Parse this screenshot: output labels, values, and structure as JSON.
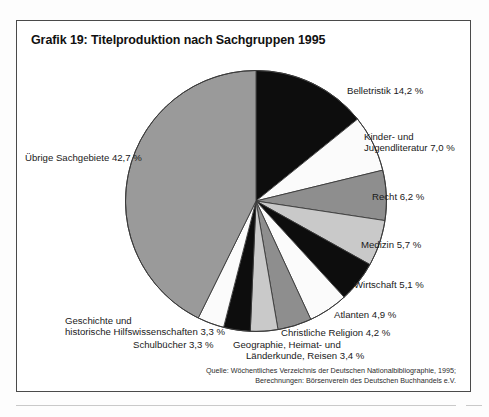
{
  "figure": {
    "title": "Grafik 19: Titelproduktion nach Sachgruppen 1995",
    "source_line_1": "Quelle: Wöchentliches Verzeichnis der Deutschen Nationalbibliographie, 1995;",
    "source_line_2": "Berechnungen: Börsenverein des Deutschen Buchhandels e.V."
  },
  "labels": {
    "belletristik": "Belletristik 14,2 %",
    "kinder_line1": "Kinder- und",
    "kinder_line2": "Jugendliteratur 7,0 %",
    "recht": "Recht 6,2 %",
    "medizin": "Medizin 5,7 %",
    "wirtschaft": "Wirtschaft 5,1 %",
    "atlanten": "Atlanten 4,9 %",
    "christliche_religion": "Christliche Religion 4,2 %",
    "geographie_line1": "Geographie, Heimat- und",
    "geographie_line2": "Länderkunde, Reisen 3,4 %",
    "schulbuecher": "Schulbücher 3,3 %",
    "geschichte_line1": "Geschichte und",
    "geschichte_line2": "historische Hilfswissenschaften 3,3 %",
    "uebrige": "Übrige Sachgebiete 42,7 %"
  },
  "chart_data": {
    "type": "pie",
    "title": "Grafik 19: Titelproduktion nach Sachgruppen 1995",
    "unit": "%",
    "start_angle_deg": 0,
    "direction": "clockwise",
    "legend": "none-inline-labels",
    "grid": false,
    "categories": [
      "Belletristik",
      "Kinder- und Jugendliteratur",
      "Recht",
      "Medizin",
      "Wirtschaft",
      "Atlanten",
      "Christliche Religion",
      "Geographie, Heimat- und Länderkunde, Reisen",
      "Schulbücher",
      "Geschichte und historische Hilfswissenschaften",
      "Übrige Sachgebiete"
    ],
    "values": [
      14.2,
      7.0,
      6.2,
      5.7,
      5.1,
      4.9,
      4.2,
      3.4,
      3.3,
      3.3,
      42.7
    ],
    "value_labels": [
      "14,2 %",
      "7,0 %",
      "6,2 %",
      "5,7 %",
      "5,1 %",
      "4,9 %",
      "4,2 %",
      "3,4 %",
      "3,3 %",
      "3,3 %",
      "42,7 %"
    ],
    "slice_colors": [
      "#0d0d0d",
      "#fbfbfb",
      "#8e8e8e",
      "#c9c9c9",
      "#0d0d0d",
      "#fbfbfb",
      "#8e8e8e",
      "#c9c9c9",
      "#0d0d0d",
      "#fbfbfb",
      "#9a9a9a"
    ],
    "stroke_color": "#3a3a3a",
    "total": 100.0
  },
  "colors": {
    "frame": "#4a4a4a",
    "black_slice": "#0d0d0d",
    "white_slice": "#fbfbfb",
    "gray_slice": "#8e8e8e",
    "light_gray_slice": "#c9c9c9",
    "large_gray_slice": "#9a9a9a",
    "text": "#1a1a1a"
  }
}
